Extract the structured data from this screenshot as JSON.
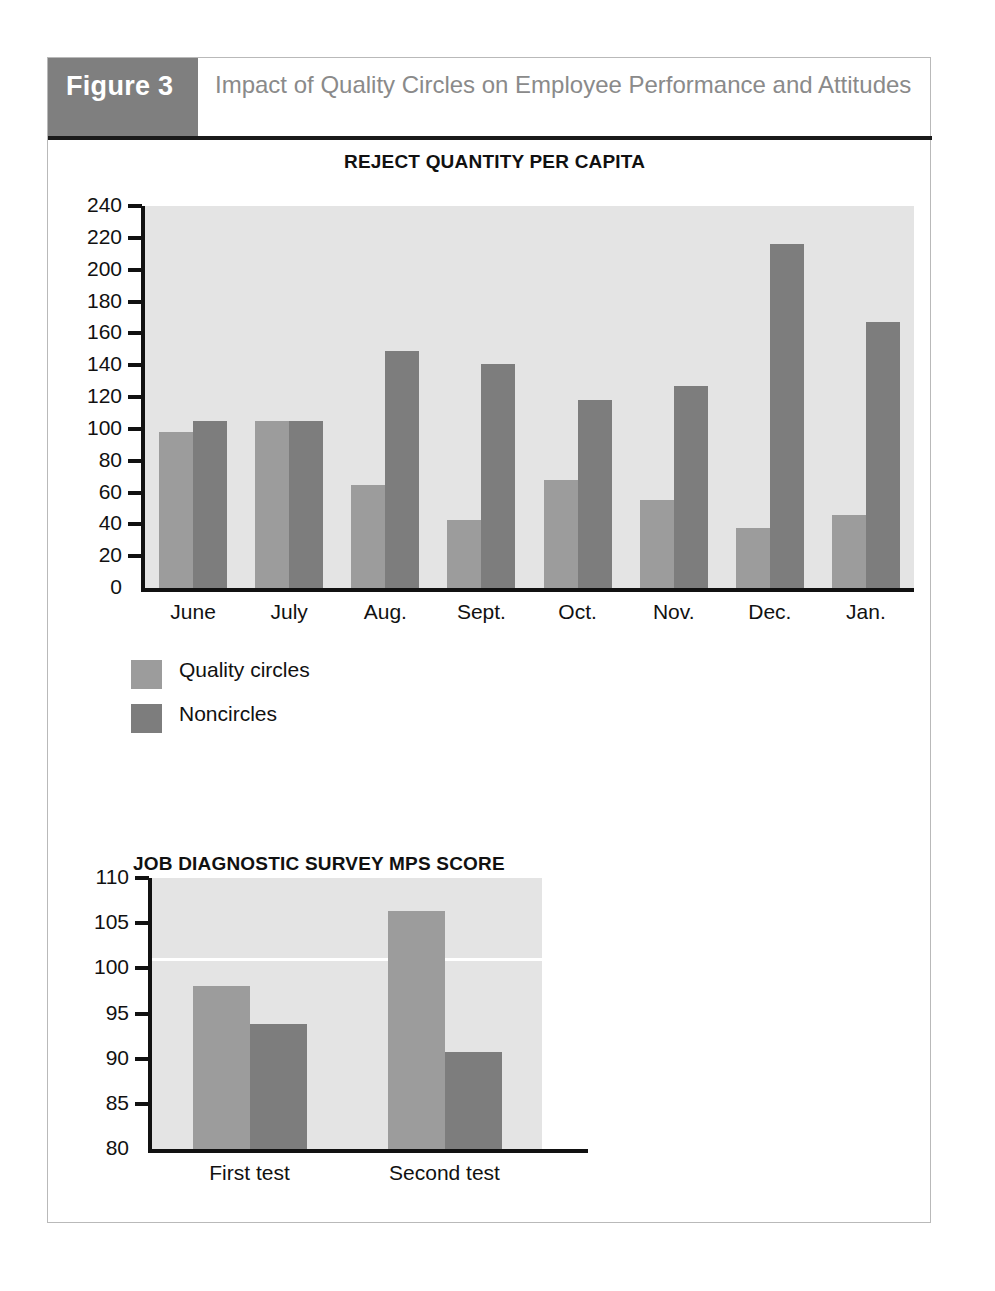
{
  "figure": {
    "tag": "Figure 3",
    "title": "Impact of Quality Circles on Employee Performance and Attitudes"
  },
  "colors": {
    "tag_background": "#7f7f7f",
    "title_text": "#8a8a8a",
    "plot_background": "#e4e4e4",
    "series_light": "#9c9c9c",
    "series_dark": "#7d7d7d",
    "axis": "#111111",
    "box_border": "#b9b9b9"
  },
  "legend": {
    "position": "below-chart-1",
    "entries": [
      {
        "label": "Quality circles",
        "color": "#9c9c9c",
        "swatch": "light"
      },
      {
        "label": "Noncircles",
        "color": "#7d7d7d",
        "swatch": "dark"
      }
    ]
  },
  "chart_data": [
    {
      "id": "reject-quantity",
      "type": "bar",
      "title": "REJECT QUANTITY PER CAPITA",
      "xlabel": "",
      "ylabel": "",
      "ylim": [
        0,
        240
      ],
      "ytick_step": 20,
      "yticks": [
        0,
        20,
        40,
        60,
        80,
        100,
        120,
        140,
        160,
        180,
        200,
        220,
        240
      ],
      "categories": [
        "June",
        "July",
        "Aug.",
        "Sept.",
        "Oct.",
        "Nov.",
        "Dec.",
        "Jan."
      ],
      "grid": false,
      "legend": [
        "Quality circles",
        "Noncircles"
      ],
      "series": [
        {
          "name": "Quality circles",
          "color": "#9c9c9c",
          "values": [
            98,
            105,
            65,
            43,
            68,
            55,
            38,
            46
          ]
        },
        {
          "name": "Noncircles",
          "color": "#7d7d7d",
          "values": [
            105,
            105,
            149,
            141,
            118,
            127,
            216,
            167
          ]
        }
      ]
    },
    {
      "id": "jds-mps-score",
      "type": "bar",
      "title": "JOB DIAGNOSTIC SURVEY MPS SCORE",
      "xlabel": "",
      "ylabel": "",
      "ylim": [
        80,
        110
      ],
      "ytick_step": 5,
      "yticks": [
        80,
        85,
        90,
        95,
        100,
        105,
        110
      ],
      "categories": [
        "First test",
        "Second test"
      ],
      "grid": false,
      "reference_line": 101,
      "legend": [
        "Quality circles",
        "Noncircles"
      ],
      "series": [
        {
          "name": "Quality circles",
          "color": "#9c9c9c",
          "values": [
            98.0,
            106.3
          ]
        },
        {
          "name": "Noncircles",
          "color": "#7d7d7d",
          "values": [
            93.8,
            90.7
          ]
        }
      ]
    }
  ]
}
